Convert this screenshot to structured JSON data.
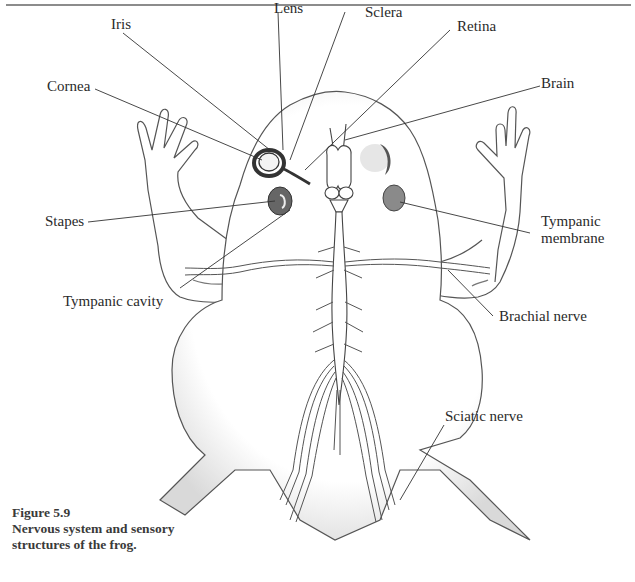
{
  "figure": {
    "number": "Figure 5.9",
    "caption_line1": "Nervous system and sensory",
    "caption_line2": "structures of the frog."
  },
  "labels": {
    "iris": "Iris",
    "lens": "Lens",
    "sclera": "Sclera",
    "retina": "Retina",
    "cornea": "Cornea",
    "brain": "Brain",
    "stapes": "Stapes",
    "tympanic_membrane_line1": "Tympanic",
    "tympanic_membrane_line2": "membrane",
    "tympanic_cavity": "Tympanic cavity",
    "brachial_nerve": "Brachial nerve",
    "sciatic_nerve": "Sciatic nerve"
  }
}
